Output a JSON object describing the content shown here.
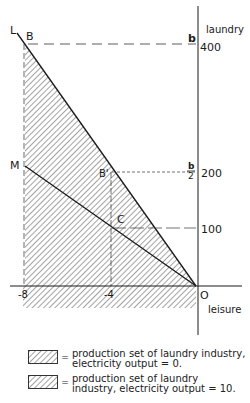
{
  "diagram": {
    "axes": {
      "y_label": "laundry",
      "x_label": "leisure",
      "origin_label": "O",
      "y_ticks": [
        "400",
        "200",
        "100"
      ],
      "x_ticks": [
        "-8",
        "-4"
      ]
    },
    "points": {
      "L": "L",
      "B": "B",
      "b": "b",
      "b_half_num": "b",
      "b_half_den": "2",
      "B_prime": "B'",
      "C": "C",
      "M": "M"
    },
    "colors": {
      "ink": "#1a1a1a",
      "hatch": "#555555",
      "background": "#ffffff"
    }
  },
  "legend": {
    "items": [
      {
        "symbol": "=",
        "line1": "production set of laundry industry,",
        "line2": "electricity output = 0."
      },
      {
        "symbol": "=",
        "line1": "production set of laundry",
        "line2": "industry, electricity output = 10."
      }
    ]
  }
}
